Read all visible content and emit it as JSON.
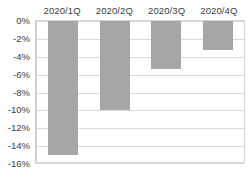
{
  "chart_data": {
    "type": "bar",
    "title": "",
    "subtitle": "",
    "xlabel": "",
    "ylabel": "",
    "categories": [
      "2020/1Q",
      "2020/2Q",
      "2020/3Q",
      "2020/4Q"
    ],
    "values": [
      -15.0,
      -10.0,
      -5.4,
      -3.3
    ],
    "value_suffix": "%",
    "ylim": [
      -16,
      0
    ],
    "ytick_labels": [
      "0%",
      "-2%",
      "-4%",
      "-6%",
      "-8%",
      "-10%",
      "-12%",
      "-14%",
      "-16%"
    ],
    "ytick_values": [
      0,
      -2,
      -4,
      -6,
      -8,
      -10,
      -12,
      -14,
      -16
    ],
    "grid": true,
    "grid_axis": "y",
    "legend": false,
    "legend_position": "none",
    "category_label_position": "top",
    "bar_color": "#a6a6a6",
    "gridline_color": "#d9d9d9",
    "axis_text_color": "#3c3c3c",
    "plot_border_color": "#d4d4d4",
    "background_color": "#ffffff"
  }
}
